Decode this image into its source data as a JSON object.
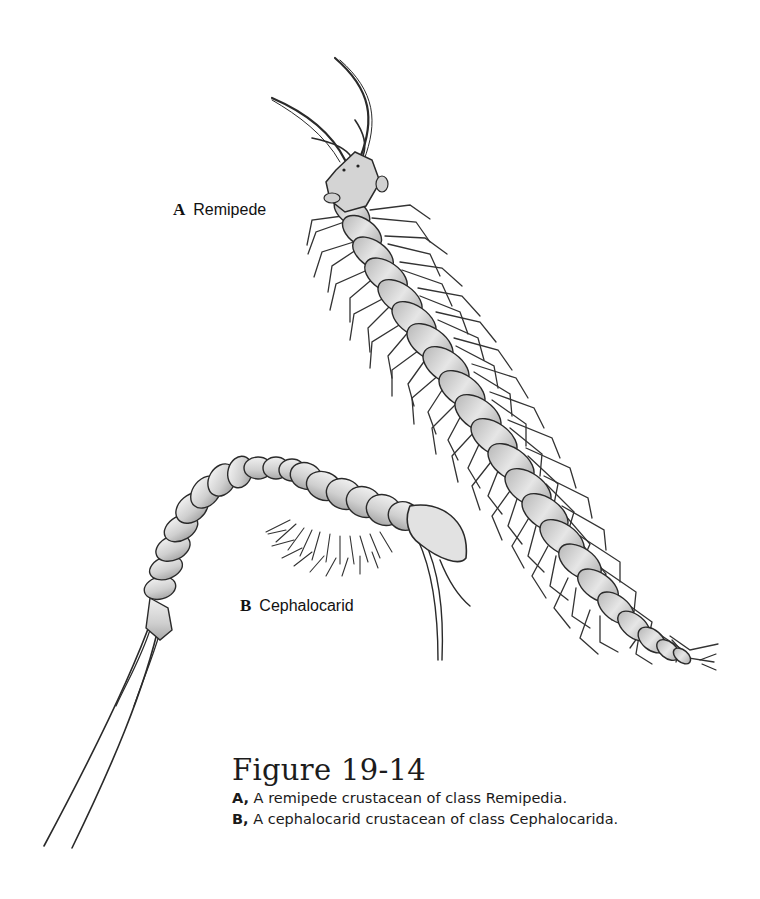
{
  "figure": {
    "panels": [
      {
        "letter": "A",
        "label": "Remipede",
        "depicts": "remipede crustacean, dorsal view, elongate segmented trunk with paired setose swimming legs, two long antennae"
      },
      {
        "letter": "B",
        "label": "Cephalocarid",
        "depicts": "cephalocarid crustacean, lateral view, curved segmented body with shield-shaped head, setose thoracic limbs and long caudal rami"
      }
    ],
    "caption": {
      "title": "Figure 19-14",
      "lines": [
        {
          "key": "A,",
          "text": " A remipede crustacean of class Remipedia."
        },
        {
          "key": "B,",
          "text": " A cephalocarid crustacean of class Cephalocarida."
        }
      ]
    }
  },
  "colors": {
    "background": "#ffffff",
    "ink": "#1a1a1a",
    "body_fill": "#d6d6d6",
    "body_shade": "#a9a9a9"
  }
}
